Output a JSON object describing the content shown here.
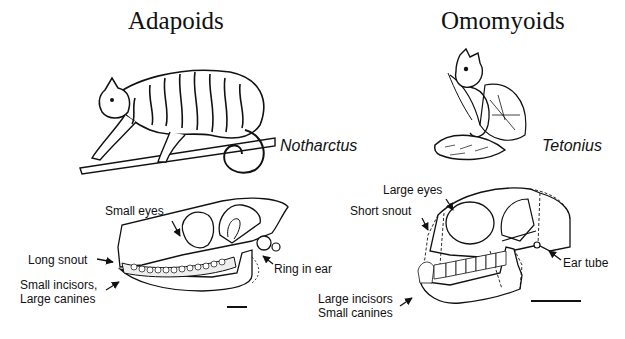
{
  "groups": {
    "left": {
      "title": "Adapoids",
      "genus": "Notharctus",
      "labels": {
        "eyes": "Small eyes",
        "snout": "Long snout",
        "teeth_line1": "Small incisors,",
        "teeth_line2": "Large canines",
        "ear": "Ring in ear"
      }
    },
    "right": {
      "title": "Omomyoids",
      "genus": "Tetonius",
      "labels": {
        "eyes": "Large eyes",
        "snout": "Short snout",
        "teeth_line1": "Large incisors",
        "teeth_line2": "Small canines",
        "ear": "Ear tube"
      }
    }
  },
  "colors": {
    "background": "#ffffff",
    "ink": "#111111"
  },
  "icons": {
    "left_animal": "notharctus-drawing-icon",
    "right_animal": "tetonius-drawing-icon",
    "left_skull": "adapoid-skull-icon",
    "right_skull": "omomyoid-skull-icon",
    "scale_bar": "scale-bar-icon",
    "arrow": "pointer-arrow-icon"
  }
}
